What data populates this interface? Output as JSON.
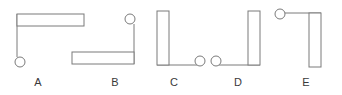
{
  "figure": {
    "stroke_color": "#7a7a7a",
    "fill_color": "#ffffff",
    "label_color": "#3a3a3a",
    "background_color": "#ffffff",
    "canvas": {
      "width": 342,
      "height": 95
    },
    "items": [
      {
        "label": "A",
        "label_x": 38,
        "description": "Horizontal bar along the top with a thin vertical rod descending from its left end to a small circle at the bottom left",
        "bar": {
          "x": 17,
          "y": 14,
          "width": 67,
          "height": 12,
          "orientation": "horizontal"
        },
        "rod": {
          "x1": 17,
          "y1": 14,
          "x2": 17,
          "y2": 57,
          "orientation": "vertical"
        },
        "ball": {
          "cx": 20,
          "cy": 62,
          "r": 5,
          "position": "bottom-left"
        }
      },
      {
        "label": "B",
        "label_x": 115,
        "description": "Horizontal bar along the bottom with a thin vertical rod rising from its right end to a small circle at the top right",
        "bar": {
          "x": 72,
          "y": 52,
          "width": 62,
          "height": 12,
          "orientation": "horizontal"
        },
        "rod": {
          "x1": 134,
          "y1": 64,
          "x2": 134,
          "y2": 24,
          "orientation": "vertical"
        },
        "ball": {
          "cx": 130,
          "cy": 19,
          "r": 5,
          "position": "top-right"
        }
      },
      {
        "label": "C",
        "label_x": 174,
        "description": "Vertical bar on the left with a thin horizontal rod extending right along the bottom to a small circle at the bottom right",
        "bar": {
          "x": 157,
          "y": 11,
          "width": 12,
          "height": 54,
          "orientation": "vertical"
        },
        "rod": {
          "x1": 157,
          "y1": 65,
          "x2": 197,
          "y2": 65,
          "orientation": "horizontal"
        },
        "ball": {
          "cx": 200,
          "cy": 61,
          "r": 5,
          "position": "bottom-right"
        }
      },
      {
        "label": "D",
        "label_x": 238,
        "description": "Small circle at the bottom left joined by a thin horizontal rod running right to a vertical bar",
        "bar": {
          "x": 248,
          "y": 11,
          "width": 12,
          "height": 54,
          "orientation": "vertical"
        },
        "rod": {
          "x1": 219,
          "y1": 65,
          "x2": 260,
          "y2": 65,
          "orientation": "horizontal"
        },
        "ball": {
          "cx": 216,
          "cy": 61,
          "r": 5,
          "position": "bottom-left"
        }
      },
      {
        "label": "E",
        "label_x": 306,
        "description": "Small circle at the top left joined by a thin horizontal rod running right to a vertical bar hanging downward",
        "bar": {
          "x": 309,
          "y": 13,
          "width": 12,
          "height": 54,
          "orientation": "vertical"
        },
        "rod": {
          "x1": 283,
          "y1": 13,
          "x2": 321,
          "y2": 13,
          "orientation": "horizontal"
        },
        "ball": {
          "cx": 280,
          "cy": 14,
          "r": 5,
          "position": "top-left"
        }
      }
    ]
  }
}
